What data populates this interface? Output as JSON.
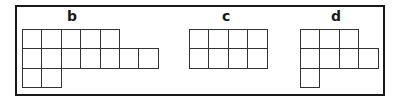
{
  "figure": {
    "panels": [
      {
        "label": "b",
        "origin": [
          22,
          29
        ],
        "rows": [
          5,
          7,
          2
        ]
      },
      {
        "label": "c",
        "origin": [
          189,
          29
        ],
        "rows": [
          4,
          4
        ]
      },
      {
        "label": "d",
        "origin": [
          300,
          29
        ],
        "rows": [
          3,
          4,
          1
        ]
      }
    ],
    "cell_size": 19.4
  },
  "colors": {
    "line": "#333333",
    "frame": "#1a1a1a",
    "background": "#ffffff"
  }
}
